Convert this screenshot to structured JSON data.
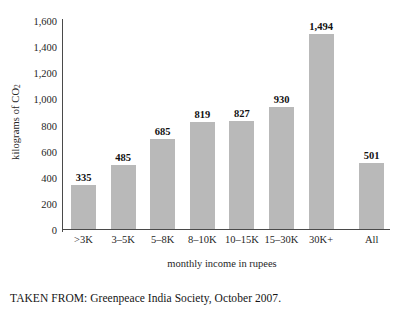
{
  "chart_data": {
    "type": "bar",
    "title": "",
    "xlabel": "monthly income in rupees",
    "ylabel": "kilograms of CO",
    "ylabel_sub": "2",
    "categories": [
      ">3K",
      "3–5K",
      "5–8K",
      "8–10K",
      "10–15K",
      "15–30K",
      "30K+",
      "All"
    ],
    "values": [
      335,
      485,
      685,
      819,
      827,
      930,
      1494,
      501
    ],
    "value_labels": [
      "335",
      "485",
      "685",
      "819",
      "827",
      "930",
      "1,494",
      "501"
    ],
    "ylim": [
      0,
      1600
    ],
    "ytick_values": [
      0,
      200,
      400,
      600,
      800,
      1000,
      1200,
      1400,
      1600
    ],
    "ytick_labels": [
      "0",
      "200",
      "400",
      "600",
      "800",
      "1,000",
      "1,200",
      "1,400",
      "1,600"
    ],
    "grid": false,
    "legend": "none",
    "bar_color": "#b9b9b9",
    "axis_color": "#4a4a4a"
  },
  "caption": {
    "text": "TAKEN FROM: Greenpeace India Society, October 2007."
  }
}
